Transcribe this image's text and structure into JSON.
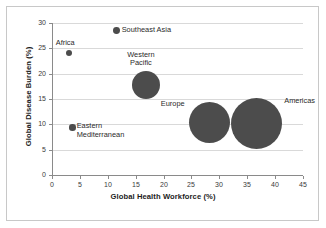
{
  "chart_data": {
    "type": "scatter",
    "title": "",
    "xlabel": "Global Health Workforce (%)",
    "ylabel": "Global Disease Burden (%)",
    "xlim": [
      0,
      45
    ],
    "ylim": [
      0,
      30
    ],
    "xticks": [
      0,
      5,
      10,
      15,
      20,
      25,
      30,
      35,
      40,
      45
    ],
    "yticks": [
      0,
      5,
      10,
      15,
      20,
      25,
      30
    ],
    "xtick_labels": [
      "0",
      "5",
      "10",
      "15",
      "20",
      "25",
      "30",
      "35",
      "40",
      "45"
    ],
    "ytick_labels": [
      "0",
      "5",
      "10",
      "15",
      "20",
      "25",
      "30"
    ],
    "grid": "horizontal",
    "legend": "none",
    "marker_color": "#4c4c4c",
    "points": [
      {
        "label": "Africa",
        "x": 3.0,
        "y": 24.1,
        "size": 3.0,
        "label_pos": "above"
      },
      {
        "label": "Eastern Mediterranean",
        "x": 3.7,
        "y": 9.4,
        "size": 3.2,
        "label_pos": "right-two-line"
      },
      {
        "label": "Southeast Asia",
        "x": 11.6,
        "y": 28.5,
        "size": 3.4,
        "label_pos": "right"
      },
      {
        "label": "Western Pacific",
        "x": 16.9,
        "y": 17.8,
        "size": 14.0,
        "label_pos": "above-two-line"
      },
      {
        "label": "Europe",
        "x": 28.2,
        "y": 10.3,
        "size": 20.5,
        "label_pos": "upper-left"
      },
      {
        "label": "Americas",
        "x": 36.7,
        "y": 10.1,
        "size": 25.5,
        "label_pos": "upper-right"
      }
    ]
  },
  "labels": {
    "africa": "Africa",
    "eastern_mediterranean_line1": "Eastern",
    "eastern_mediterranean_line2": "Mediterranean",
    "southeast_asia": "Southeast Asia",
    "western_pacific_line1": "Western",
    "western_pacific_line2": "Pacific",
    "europe": "Europe",
    "americas": "Americas"
  }
}
